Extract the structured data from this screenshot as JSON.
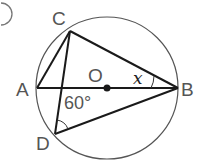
{
  "diagram": {
    "type": "circle-geometry",
    "points": {
      "A": {
        "label": "A",
        "x": 37,
        "y": 88
      },
      "B": {
        "label": "B",
        "x": 178,
        "y": 88
      },
      "C": {
        "label": "C",
        "x": 70,
        "y": 31
      },
      "D": {
        "label": "D",
        "x": 55,
        "y": 134
      },
      "O": {
        "label": "O",
        "x": 107,
        "y": 88
      }
    },
    "angle_labels": {
      "x": "x",
      "d": "60°"
    },
    "partial_marker": ")",
    "colors": {
      "line": "#1a1a1a",
      "circle": "#555555",
      "text": "#555555"
    }
  }
}
